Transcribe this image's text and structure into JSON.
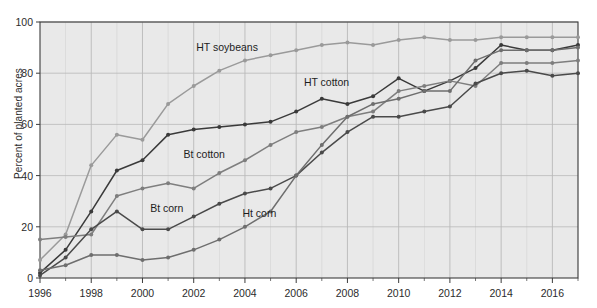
{
  "chart_data": {
    "type": "line",
    "title": "",
    "subtitle": "",
    "xlabel": "",
    "ylabel": "Percent of planted acres",
    "xlim": [
      1996,
      2017
    ],
    "ylim": [
      0,
      100
    ],
    "grid": true,
    "legend_position": "inline-labels",
    "x": [
      1996,
      1997,
      1998,
      1999,
      2000,
      2001,
      2002,
      2003,
      2004,
      2005,
      2006,
      2007,
      2008,
      2009,
      2010,
      2011,
      2012,
      2013,
      2014,
      2015,
      2016,
      2017
    ],
    "ytick_labels": [
      "0",
      "20",
      "40",
      "60",
      "80",
      "100"
    ],
    "ytick_values": [
      0,
      20,
      40,
      60,
      80,
      100
    ],
    "xtick_labels": [
      "1996",
      "1998",
      "2000",
      "2002",
      "2004",
      "2006",
      "2008",
      "2010",
      "2012",
      "2014",
      "2016"
    ],
    "xtick_values": [
      1996,
      1998,
      2000,
      2002,
      2004,
      2006,
      2008,
      2010,
      2012,
      2014,
      2016
    ],
    "series": [
      {
        "name": "HT soybeans",
        "color": "#9a9a9a",
        "label_x": 2002.1,
        "label_y": 90,
        "values": [
          7,
          17,
          44,
          56,
          54,
          68,
          75,
          81,
          85,
          87,
          89,
          91,
          92,
          91,
          93,
          94,
          93,
          93,
          94,
          94,
          94,
          94
        ]
      },
      {
        "name": "HT cotton",
        "color": "#3a3a3a",
        "label_x": 2006.3,
        "label_y": 76,
        "values": [
          2,
          11,
          26,
          42,
          46,
          56,
          58,
          59,
          60,
          61,
          65,
          70,
          68,
          71,
          78,
          73,
          77,
          82,
          91,
          89,
          89,
          91
        ]
      },
      {
        "name": "Bt cotton",
        "color": "#7e7e7e",
        "label_x": 2001.6,
        "label_y": 48,
        "values": [
          15,
          16,
          17,
          32,
          35,
          37,
          35,
          41,
          46,
          52,
          57,
          59,
          63,
          65,
          73,
          75,
          77,
          75,
          84,
          84,
          84,
          85
        ]
      },
      {
        "name": "Bt corn",
        "color": "#4a4a4a",
        "label_x": 2000.3,
        "label_y": 27,
        "values": [
          1,
          8,
          19,
          26,
          19,
          19,
          24,
          29,
          33,
          35,
          40,
          49,
          57,
          63,
          63,
          65,
          67,
          76,
          80,
          81,
          79,
          80
        ]
      },
      {
        "name": "Ht corn",
        "color": "#6e6e6e",
        "label_x": 2003.9,
        "label_y": 25,
        "values": [
          3,
          5,
          9,
          9,
          7,
          8,
          11,
          15,
          20,
          26,
          40,
          52,
          63,
          68,
          70,
          73,
          73,
          85,
          89,
          89,
          89,
          90
        ]
      }
    ]
  },
  "axes": {
    "plot_bg": "#e9e9e9",
    "grid_color": "#b9b9b9",
    "border_color": "#3c3c3c",
    "text_color": "#2b2b2b"
  }
}
